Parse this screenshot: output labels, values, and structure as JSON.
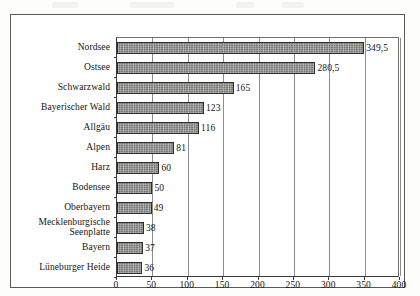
{
  "chart_data": {
    "type": "bar",
    "orientation": "horizontal",
    "title": "",
    "subtitle": "",
    "xlabel": "",
    "ylabel": "",
    "xlim": [
      0,
      400
    ],
    "xticks": [
      0,
      50,
      100,
      150,
      200,
      250,
      300,
      350,
      400
    ],
    "xtick_labels": [
      "0",
      "50",
      "100",
      "150",
      "200",
      "250",
      "300",
      "350",
      "400"
    ],
    "grid": "vertical",
    "legend": null,
    "categories": [
      "Nordsee",
      "Ostsee",
      "Schwarzwald",
      "Bayerischer Wald",
      "Allgäu",
      "Alpen",
      "Harz",
      "Bodensee",
      "Oberbayern",
      "Mecklenburgische Seenplatte",
      "Bayern",
      "Lüneburger Heide"
    ],
    "category_lines": [
      [
        "Nordsee"
      ],
      [
        "Ostsee"
      ],
      [
        "Schwarzwald"
      ],
      [
        "Bayerischer Wald"
      ],
      [
        "Allgäu"
      ],
      [
        "Alpen"
      ],
      [
        "Harz"
      ],
      [
        "Bodensee"
      ],
      [
        "Oberbayern"
      ],
      [
        "Mecklenburgische",
        "Seenplatte"
      ],
      [
        "Bayern"
      ],
      [
        "Lüneburger Heide"
      ]
    ],
    "values": [
      349.5,
      280.5,
      165,
      123,
      116,
      81,
      60,
      50,
      49,
      38,
      37,
      36
    ],
    "value_labels": [
      "349,5",
      "280,5",
      "165",
      "123",
      "116",
      "81",
      "60",
      "50",
      "49",
      "38",
      "37",
      "36"
    ],
    "bar_color": "#8d8d8b",
    "bar_edge_color": "#2e2e2c",
    "grid_color": "#8d8d8b",
    "text_color": "#141412",
    "background_color": "#ffffff"
  }
}
